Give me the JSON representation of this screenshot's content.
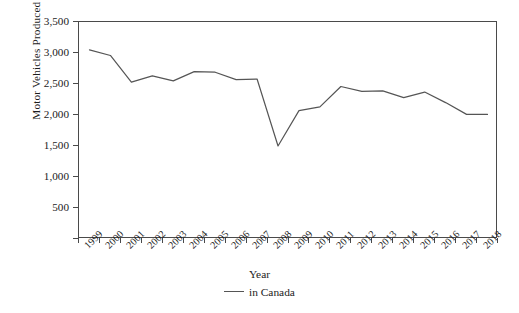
{
  "chart_data": {
    "type": "line",
    "title": "",
    "xlabel": "Year",
    "ylabel": "Motor Vehicles Produced (thousands)",
    "categories": [
      "1999",
      "2000",
      "2001",
      "2002",
      "2003",
      "2004",
      "2005",
      "2006",
      "2007",
      "2008",
      "2009",
      "2010",
      "2011",
      "2012",
      "2013",
      "2014",
      "2015",
      "2016",
      "2017",
      "2018"
    ],
    "series": [
      {
        "name": "in Canada",
        "color": "#555555",
        "values": [
          3050,
          2960,
          2530,
          2630,
          2550,
          2700,
          2690,
          2570,
          2580,
          1500,
          2070,
          2130,
          2460,
          2380,
          2390,
          2280,
          2370,
          2200,
          2010,
          2010
        ]
      }
    ],
    "ylim": [
      0,
      3500
    ],
    "yticks": [
      0,
      500,
      1000,
      1500,
      2000,
      2500,
      3000,
      3500
    ],
    "ytick_labels": [
      "",
      "500",
      "1,000",
      "1,500",
      "2,000",
      "2,500",
      "3,000",
      "3,500"
    ],
    "grid": false,
    "legend_position": "bottom-center"
  },
  "axes": {
    "y_title": "Motor Vehicles Produced (thousands)",
    "x_title": "Year"
  },
  "legend": {
    "entries": [
      {
        "label": "in Canada",
        "color": "#555555"
      }
    ]
  },
  "colors": {
    "line": "#555555",
    "axis": "#4a4a4a",
    "text": "#1c1c1c",
    "background": "#ffffff"
  }
}
